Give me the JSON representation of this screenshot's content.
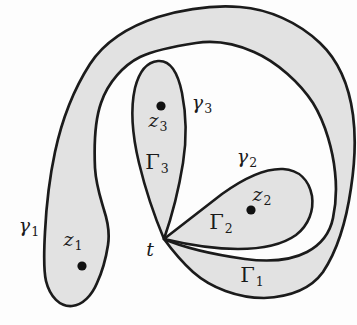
{
  "figure": {
    "colors": {
      "background": "#fdfdfd",
      "region_fill": "#e2e2e2",
      "outline": "#1b1b1b",
      "dot": "#111111"
    },
    "labels": {
      "gamma1": {
        "main": "γ",
        "sub": "1"
      },
      "gamma2": {
        "main": "γ",
        "sub": "2"
      },
      "gamma3": {
        "main": "γ",
        "sub": "3"
      },
      "Gamma1": {
        "main": "Γ",
        "sub": "1"
      },
      "Gamma2": {
        "main": "Γ",
        "sub": "2"
      },
      "Gamma3": {
        "main": "Γ",
        "sub": "3"
      },
      "z1": {
        "main": "z",
        "sub": "1"
      },
      "z2": {
        "main": "z",
        "sub": "2"
      },
      "z3": {
        "main": "z",
        "sub": "3"
      },
      "t": {
        "main": "t",
        "sub": ""
      }
    }
  }
}
